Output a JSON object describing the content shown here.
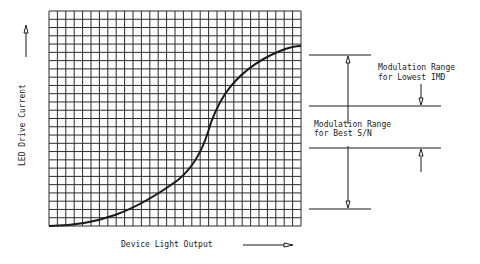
{
  "chart_data": {
    "type": "line",
    "title": "",
    "xlabel": "Device Light Output",
    "ylabel": "LED Drive Current",
    "grid": true,
    "grid_columns": 30,
    "grid_rows": 26,
    "series": [
      {
        "name": "LED transfer curve",
        "note": "S-shaped curve, normalized 0-1 on both axes (x = position across grid, y = height)",
        "x": [
          0.0,
          0.12,
          0.24,
          0.34,
          0.44,
          0.5,
          0.6,
          0.63,
          0.65,
          0.68,
          0.72,
          0.76,
          0.85,
          0.96,
          1.0
        ],
        "y": [
          0.0,
          0.01,
          0.04,
          0.09,
          0.15,
          0.2,
          0.35,
          0.44,
          0.54,
          0.59,
          0.68,
          0.72,
          0.8,
          0.83,
          0.84
        ]
      }
    ],
    "annotations": [
      {
        "text": "Modulation Range for Lowest IMD",
        "range": "between upper level lines"
      },
      {
        "text": "Modulation Range for Best S/N",
        "range": "between outer level lines"
      }
    ]
  },
  "axes": {
    "y_label": "LED Drive Current",
    "x_label": "Device Light Output"
  },
  "annotations": {
    "lowest_imd": {
      "line1": "Modulation Range",
      "line2": "for Lowest IMD"
    },
    "best_sn": {
      "line1": "Modulation Range",
      "line2": "for Best S/N"
    }
  },
  "colors": {
    "ink": "#1a1a1a",
    "grid": "#2a2a2a",
    "background": "#ffffff"
  }
}
